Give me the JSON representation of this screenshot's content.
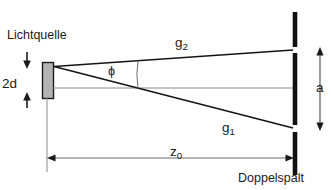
{
  "diagram": {
    "labels": {
      "light_source": "Lichtquelle",
      "source_width": "2d",
      "angle": "ϕ",
      "ray_upper_base": "g",
      "ray_upper_sub": "2",
      "ray_lower_base": "g",
      "ray_lower_sub": "1",
      "slit_separation": "a",
      "distance_base": "z",
      "distance_sub": "0",
      "screen": "Doppelspalt"
    },
    "colors": {
      "stroke": "#1a1a1a",
      "ray": "#141414",
      "dimension": "#6d6d6d",
      "source_fill": "#b3b3b3",
      "source_border": "#1a1a1a",
      "background": "#ffffff"
    },
    "geometry": {
      "source_block": {
        "x": 42,
        "y": 62,
        "width": 11,
        "height": 36
      },
      "ray_origin": {
        "x": 54,
        "y": 66
      },
      "screen_x": 294,
      "screen_top": 12,
      "screen_bottom": 175,
      "slit_upper_y": 50,
      "slit_lower_y": 128,
      "axis_y": 88,
      "dimension_y": 158,
      "angle_arc_x": 138
    }
  }
}
